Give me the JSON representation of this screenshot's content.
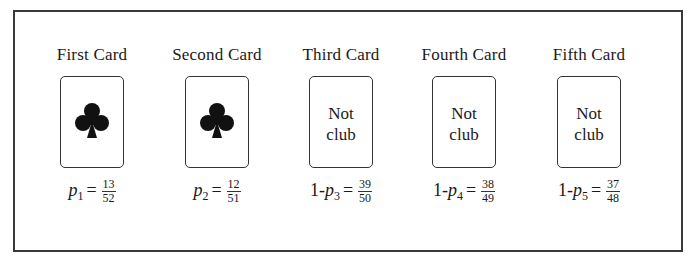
{
  "diagram": {
    "cards": [
      {
        "title": "First Card",
        "face": "club",
        "face_label": "",
        "prefix": "",
        "var": "p",
        "sub": "1",
        "eq": "=",
        "num": "13",
        "den": "52"
      },
      {
        "title": "Second Card",
        "face": "club",
        "face_label": "",
        "prefix": "",
        "var": "p",
        "sub": "2",
        "eq": "=",
        "num": "12",
        "den": "51"
      },
      {
        "title": "Third Card",
        "face": "text",
        "face_label_line1": "Not",
        "face_label_line2": "club",
        "prefix": "1-",
        "var": "p",
        "sub": "3",
        "eq": "=",
        "num": "39",
        "den": "50"
      },
      {
        "title": "Fourth Card",
        "face": "text",
        "face_label_line1": "Not",
        "face_label_line2": "club",
        "prefix": "1-",
        "var": "p",
        "sub": "4",
        "eq": "=",
        "num": "38",
        "den": "49"
      },
      {
        "title": "Fifth Card",
        "face": "text",
        "face_label_line1": "Not",
        "face_label_line2": "club",
        "prefix": "1-",
        "var": "p",
        "sub": "5",
        "eq": "=",
        "num": "37",
        "den": "48"
      }
    ],
    "icons": {
      "club": "club-suit-icon"
    },
    "colors": {
      "ink": "#1a1a1a",
      "border": "#3a3a3a",
      "background": "#ffffff"
    }
  }
}
